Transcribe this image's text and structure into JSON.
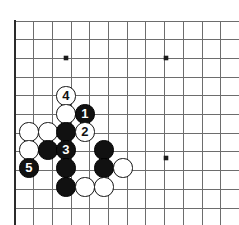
{
  "figure": {
    "kind": "go-board-diagram",
    "background_color": "#ffffff"
  },
  "board": {
    "line_color": "#6d6d6d",
    "border_color": "#2b2b2b",
    "star_point_color": "#1a1a1a",
    "origin_x": 15,
    "origin_y": 21,
    "spacing": 18.7,
    "columns": 12,
    "rows": 11,
    "star_points": [
      {
        "x": 66,
        "y": 58
      },
      {
        "x": 166,
        "y": 58
      },
      {
        "x": 166,
        "y": 158
      }
    ]
  },
  "stones": [
    {
      "id": "w-4",
      "color": "white",
      "label": "4",
      "x": 66,
      "y": 96
    },
    {
      "id": "w-a",
      "color": "white",
      "label": "",
      "x": 66,
      "y": 114
    },
    {
      "id": "b-1",
      "color": "black",
      "label": "1",
      "x": 85,
      "y": 114
    },
    {
      "id": "w-b",
      "color": "white",
      "label": "",
      "x": 29,
      "y": 132
    },
    {
      "id": "w-c",
      "color": "white",
      "label": "",
      "x": 48,
      "y": 132
    },
    {
      "id": "b-a",
      "color": "black",
      "label": "",
      "x": 66,
      "y": 132
    },
    {
      "id": "w-2",
      "color": "white",
      "label": "2",
      "x": 85,
      "y": 132
    },
    {
      "id": "w-d",
      "color": "white",
      "label": "",
      "x": 29,
      "y": 150
    },
    {
      "id": "b-b",
      "color": "black",
      "label": "",
      "x": 48,
      "y": 150
    },
    {
      "id": "b-3",
      "color": "black",
      "label": "3",
      "x": 66,
      "y": 150
    },
    {
      "id": "b-c",
      "color": "black",
      "label": "",
      "x": 104,
      "y": 150
    },
    {
      "id": "b-5",
      "color": "black",
      "label": "5",
      "x": 29,
      "y": 168
    },
    {
      "id": "b-d",
      "color": "black",
      "label": "",
      "x": 66,
      "y": 168
    },
    {
      "id": "b-e",
      "color": "black",
      "label": "",
      "x": 104,
      "y": 168
    },
    {
      "id": "w-e",
      "color": "white",
      "label": "",
      "x": 123,
      "y": 168
    },
    {
      "id": "b-f",
      "color": "black",
      "label": "",
      "x": 66,
      "y": 187
    },
    {
      "id": "w-f",
      "color": "white",
      "label": "",
      "x": 85,
      "y": 187
    },
    {
      "id": "w-g",
      "color": "white",
      "label": "",
      "x": 104,
      "y": 187
    }
  ],
  "stone_radius": 9.6
}
